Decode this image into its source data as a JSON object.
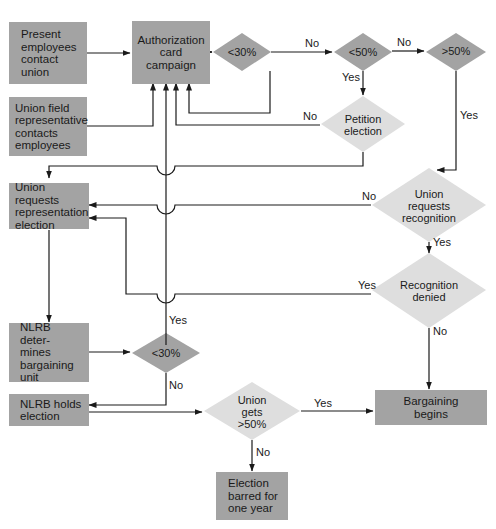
{
  "diagram": {
    "type": "flowchart",
    "colors": {
      "box": "#a3a3a3",
      "decision_dark": "#a3a3a3",
      "decision_light": "#dedede",
      "line": "#1a1a1a"
    },
    "boxes": {
      "present_employees": [
        "Present",
        "employees",
        "contact",
        "union"
      ],
      "union_field_rep": [
        "Union field",
        "representative",
        "contacts",
        "employees"
      ],
      "auth_card": [
        "Authorization",
        "card",
        "campaign"
      ],
      "union_requests_election": [
        "Union requests",
        "representation",
        "election"
      ],
      "nlrb_determines": [
        "NLRB deter-",
        "mines",
        "bargaining",
        "unit"
      ],
      "nlrb_holds": [
        "NLRB holds",
        "election"
      ],
      "bargaining_begins": [
        "Bargaining",
        "begins"
      ],
      "election_barred": [
        "Election",
        "barred for",
        "one year"
      ]
    },
    "decisions": {
      "lt30_top": [
        "<30%"
      ],
      "lt50": [
        "<50%"
      ],
      "gt50": [
        ">50%"
      ],
      "petition_election": [
        "Petition",
        "election"
      ],
      "union_requests_recognition": [
        "Union",
        "requests",
        "recognition"
      ],
      "recognition_denied": [
        "Recognition",
        "denied"
      ],
      "lt30_bottom": [
        "<30%"
      ],
      "union_gets_gt50": [
        "Union",
        "gets",
        ">50%"
      ]
    },
    "edge_labels": {
      "lt30_to_lt50": "No",
      "lt50_to_gt50": "No",
      "lt50_to_petition": "Yes",
      "petition_no": "No",
      "gt50_yes": "Yes",
      "recognition_no": "No",
      "recognition_yes": "Yes",
      "denied_yes": "Yes",
      "denied_no": "No",
      "lt30b_yes": "Yes",
      "lt30b_no": "No",
      "gets50_yes": "Yes",
      "gets50_no": "No"
    }
  }
}
